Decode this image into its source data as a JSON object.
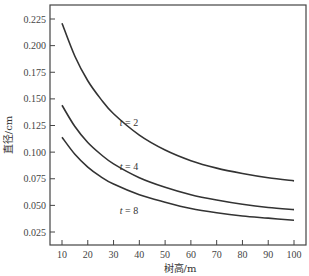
{
  "chart_data": {
    "type": "line",
    "title": "",
    "xlabel": "树高/m",
    "ylabel": "直径/cm",
    "xlim": [
      5,
      105
    ],
    "ylim": [
      0.012,
      0.238
    ],
    "x_ticks": [
      10,
      20,
      30,
      40,
      50,
      60,
      70,
      80,
      90,
      100
    ],
    "y_ticks": [
      0.025,
      0.05,
      0.075,
      0.1,
      0.125,
      0.15,
      0.175,
      0.2,
      0.225
    ],
    "y_tick_labels": [
      "0.025",
      "0.050",
      "0.075",
      "0.100",
      "0.125",
      "0.150",
      "0.175",
      "0.200",
      "0.225"
    ],
    "x_tick_labels": [
      "10",
      "20",
      "30",
      "40",
      "50",
      "60",
      "70",
      "80",
      "90",
      "100"
    ],
    "grid": false,
    "series": [
      {
        "name": "t = 2",
        "label_var": "t",
        "label_value": "2",
        "label_pos": {
          "x": 36,
          "y": 0.125
        },
        "x": [
          10,
          15,
          20,
          25,
          30,
          40,
          50,
          60,
          70,
          80,
          90,
          100
        ],
        "values": [
          0.221,
          0.19,
          0.167,
          0.15,
          0.136,
          0.116,
          0.102,
          0.092,
          0.085,
          0.08,
          0.076,
          0.073
        ]
      },
      {
        "name": "t = 4",
        "label_var": "t",
        "label_value": "4",
        "label_pos": {
          "x": 36,
          "y": 0.083
        },
        "x": [
          10,
          15,
          20,
          25,
          30,
          40,
          50,
          60,
          70,
          80,
          90,
          100
        ],
        "values": [
          0.144,
          0.124,
          0.109,
          0.098,
          0.089,
          0.076,
          0.067,
          0.06,
          0.055,
          0.051,
          0.048,
          0.046
        ]
      },
      {
        "name": "t = 8",
        "label_var": "t",
        "label_value": "8",
        "label_pos": {
          "x": 36,
          "y": 0.042
        },
        "x": [
          10,
          15,
          20,
          25,
          30,
          40,
          50,
          60,
          70,
          80,
          90,
          100
        ],
        "values": [
          0.114,
          0.098,
          0.086,
          0.077,
          0.07,
          0.06,
          0.053,
          0.047,
          0.043,
          0.04,
          0.038,
          0.036
        ]
      }
    ],
    "line_color": "#333333"
  }
}
